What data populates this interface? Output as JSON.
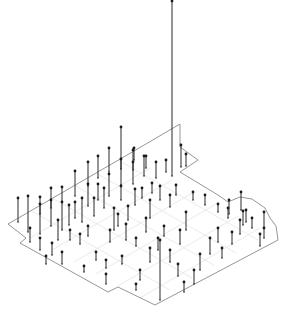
{
  "chart_data": {
    "type": "scatter",
    "subtype": "3d-stem-on-map",
    "title": "",
    "xlabel": "",
    "ylabel": "",
    "zlabel": "",
    "grid": true,
    "legend": null,
    "colors": {
      "background": "#ffffff",
      "outline": "#8a8a8a",
      "grid": "#e4e4e4",
      "stem": "#2a2a2a",
      "marker": "#1a1a1a"
    },
    "outline_points": [
      [
        134,
        151
      ],
      [
        180,
        124
      ],
      [
        180,
        147
      ],
      [
        198,
        160
      ],
      [
        180,
        172
      ],
      [
        218,
        195
      ],
      [
        228,
        202
      ],
      [
        240,
        197
      ],
      [
        252,
        199
      ],
      [
        265,
        208
      ],
      [
        270,
        218
      ],
      [
        276,
        226
      ],
      [
        278,
        240
      ],
      [
        155,
        305
      ],
      [
        118,
        287
      ],
      [
        108,
        292
      ],
      [
        20,
        243
      ],
      [
        26,
        238
      ],
      [
        8,
        224
      ],
      [
        134,
        151
      ]
    ],
    "grid_lines": [
      [
        [
          30,
          210
        ],
        [
          170,
          290
        ]
      ],
      [
        [
          52,
          198
        ],
        [
          192,
          278
        ]
      ],
      [
        [
          74,
          185
        ],
        [
          214,
          265
        ]
      ],
      [
        [
          96,
          173
        ],
        [
          236,
          253
        ]
      ],
      [
        [
          118,
          160
        ],
        [
          258,
          240
        ]
      ],
      [
        [
          30,
          238
        ],
        [
          150,
          168
        ]
      ],
      [
        [
          52,
          250
        ],
        [
          172,
          180
        ]
      ],
      [
        [
          74,
          262
        ],
        [
          194,
          192
        ]
      ],
      [
        [
          96,
          274
        ],
        [
          216,
          204
        ]
      ],
      [
        [
          118,
          286
        ],
        [
          238,
          216
        ]
      ],
      [
        [
          140,
          298
        ],
        [
          260,
          228
        ]
      ]
    ],
    "stems": [
      {
        "x": 172,
        "y": 176,
        "h": 175
      },
      {
        "x": 121,
        "y": 169,
        "h": 42
      },
      {
        "x": 18,
        "y": 222,
        "h": 24
      },
      {
        "x": 28,
        "y": 232,
        "h": 36
      },
      {
        "x": 40,
        "y": 214,
        "h": 17
      },
      {
        "x": 40,
        "y": 234,
        "h": 30
      },
      {
        "x": 51,
        "y": 208,
        "h": 20
      },
      {
        "x": 51,
        "y": 226,
        "h": 26
      },
      {
        "x": 62,
        "y": 202,
        "h": 15
      },
      {
        "x": 62,
        "y": 230,
        "h": 28
      },
      {
        "x": 69,
        "y": 225,
        "h": 20
      },
      {
        "x": 75,
        "y": 196,
        "h": 25
      },
      {
        "x": 75,
        "y": 218,
        "h": 16
      },
      {
        "x": 88,
        "y": 186,
        "h": 24
      },
      {
        "x": 88,
        "y": 206,
        "h": 22
      },
      {
        "x": 98,
        "y": 178,
        "h": 22
      },
      {
        "x": 98,
        "y": 200,
        "h": 16
      },
      {
        "x": 109,
        "y": 172,
        "h": 24
      },
      {
        "x": 109,
        "y": 196,
        "h": 22
      },
      {
        "x": 121,
        "y": 185,
        "h": 26
      },
      {
        "x": 121,
        "y": 200,
        "h": 14
      },
      {
        "x": 133,
        "y": 170,
        "h": 20
      },
      {
        "x": 133,
        "y": 184,
        "h": 22
      },
      {
        "x": 134,
        "y": 160,
        "h": 12
      },
      {
        "x": 144,
        "y": 176,
        "h": 20
      },
      {
        "x": 146,
        "y": 168,
        "h": 12
      },
      {
        "x": 156,
        "y": 178,
        "h": 16
      },
      {
        "x": 166,
        "y": 172,
        "h": 12
      },
      {
        "x": 181,
        "y": 167,
        "h": 22
      },
      {
        "x": 186,
        "y": 166,
        "h": 12
      },
      {
        "x": 135,
        "y": 205,
        "h": 16
      },
      {
        "x": 142,
        "y": 198,
        "h": 10
      },
      {
        "x": 152,
        "y": 193,
        "h": 10
      },
      {
        "x": 160,
        "y": 200,
        "h": 14
      },
      {
        "x": 170,
        "y": 207,
        "h": 12
      },
      {
        "x": 176,
        "y": 195,
        "h": 10
      },
      {
        "x": 193,
        "y": 200,
        "h": 8
      },
      {
        "x": 205,
        "y": 205,
        "h": 10
      },
      {
        "x": 218,
        "y": 212,
        "h": 8
      },
      {
        "x": 228,
        "y": 218,
        "h": 10
      },
      {
        "x": 229,
        "y": 214,
        "h": 14
      },
      {
        "x": 241,
        "y": 210,
        "h": 18
      },
      {
        "x": 243,
        "y": 225,
        "h": 14
      },
      {
        "x": 264,
        "y": 228,
        "h": 16
      },
      {
        "x": 264,
        "y": 238,
        "h": 10
      },
      {
        "x": 30,
        "y": 242,
        "h": 14
      },
      {
        "x": 40,
        "y": 250,
        "h": 12
      },
      {
        "x": 52,
        "y": 255,
        "h": 12
      },
      {
        "x": 62,
        "y": 264,
        "h": 12
      },
      {
        "x": 70,
        "y": 240,
        "h": 10
      },
      {
        "x": 80,
        "y": 244,
        "h": 10
      },
      {
        "x": 88,
        "y": 236,
        "h": 10
      },
      {
        "x": 96,
        "y": 260,
        "h": 8
      },
      {
        "x": 106,
        "y": 268,
        "h": 8
      },
      {
        "x": 110,
        "y": 242,
        "h": 12
      },
      {
        "x": 118,
        "y": 226,
        "h": 12
      },
      {
        "x": 128,
        "y": 220,
        "h": 14
      },
      {
        "x": 136,
        "y": 246,
        "h": 8
      },
      {
        "x": 146,
        "y": 232,
        "h": 14
      },
      {
        "x": 150,
        "y": 218,
        "h": 18
      },
      {
        "x": 158,
        "y": 250,
        "h": 12
      },
      {
        "x": 160,
        "y": 300,
        "h": 60
      },
      {
        "x": 164,
        "y": 236,
        "h": 10
      },
      {
        "x": 170,
        "y": 262,
        "h": 12
      },
      {
        "x": 180,
        "y": 244,
        "h": 14
      },
      {
        "x": 186,
        "y": 230,
        "h": 18
      },
      {
        "x": 194,
        "y": 284,
        "h": 14
      },
      {
        "x": 200,
        "y": 270,
        "h": 16
      },
      {
        "x": 210,
        "y": 254,
        "h": 16
      },
      {
        "x": 218,
        "y": 242,
        "h": 14
      },
      {
        "x": 222,
        "y": 258,
        "h": 10
      },
      {
        "x": 232,
        "y": 244,
        "h": 12
      },
      {
        "x": 240,
        "y": 234,
        "h": 14
      },
      {
        "x": 246,
        "y": 222,
        "h": 12
      },
      {
        "x": 252,
        "y": 228,
        "h": 10
      },
      {
        "x": 260,
        "y": 246,
        "h": 12
      },
      {
        "x": 106,
        "y": 284,
        "h": 10
      },
      {
        "x": 122,
        "y": 264,
        "h": 8
      },
      {
        "x": 84,
        "y": 272,
        "h": 6
      },
      {
        "x": 140,
        "y": 280,
        "h": 10
      },
      {
        "x": 150,
        "y": 262,
        "h": 14
      },
      {
        "x": 178,
        "y": 276,
        "h": 12
      },
      {
        "x": 184,
        "y": 292,
        "h": 10
      },
      {
        "x": 136,
        "y": 290,
        "h": 6
      },
      {
        "x": 46,
        "y": 264,
        "h": 8
      },
      {
        "x": 58,
        "y": 240,
        "h": 20
      },
      {
        "x": 82,
        "y": 222,
        "h": 24
      },
      {
        "x": 94,
        "y": 216,
        "h": 18
      },
      {
        "x": 104,
        "y": 208,
        "h": 20
      },
      {
        "x": 114,
        "y": 230,
        "h": 22
      },
      {
        "x": 126,
        "y": 240,
        "h": 16
      }
    ]
  }
}
